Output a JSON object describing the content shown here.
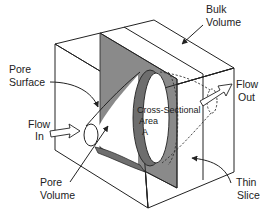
{
  "figure": {
    "type": "isometric-block-diagram"
  },
  "labels": {
    "bulk_volume": [
      "Bulk",
      "Volume"
    ],
    "pore_surface": [
      "Pore",
      "Surface"
    ],
    "flow_in": [
      "Flow",
      "In"
    ],
    "flow_out": [
      "Flow",
      "Out"
    ],
    "cross_sectional_area": [
      "Cross-Sectional",
      "Area",
      "A"
    ],
    "pore_volume": [
      "Pore",
      "Volume"
    ],
    "thin_slice": [
      "Thin",
      "Slice"
    ]
  },
  "colors": {
    "line": "#222222",
    "slice_fill": "#8a8a8a",
    "pore_wall_fill": "#6e6e6e",
    "background": "#ffffff",
    "text": "#222222"
  }
}
